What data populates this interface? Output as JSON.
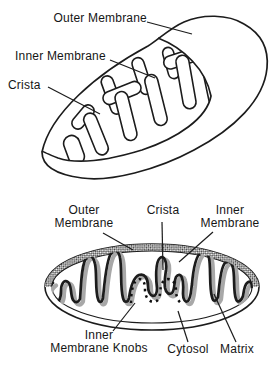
{
  "figure": {
    "colors": {
      "line": "#1c1c1c",
      "shadow": "#a8a8a8",
      "hatch": "#3a3a3a",
      "background": "#ffffff"
    },
    "top_diagram": {
      "type": "3d-cutaway",
      "labels": {
        "outer_membrane": "Outer Membrane",
        "inner_membrane": "Inner Membrane",
        "crista": "Crista"
      }
    },
    "bottom_diagram": {
      "type": "cross-section",
      "labels": {
        "outer_membrane_line1": "Outer",
        "outer_membrane_line2": "Membrane",
        "crista": "Crista",
        "inner_membrane_line1": "Inner",
        "inner_membrane_line2": "Membrane",
        "knobs_line1": "Inner",
        "knobs_line2": "Membrane Knobs",
        "cytosol": "Cytosol",
        "matrix": "Matrix"
      }
    }
  }
}
